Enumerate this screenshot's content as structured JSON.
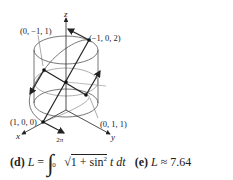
{
  "figure": {
    "axes": {
      "x": "x",
      "y": "y",
      "z": "z"
    },
    "points": {
      "p1": "(0, −1, 1)",
      "p2": "(−1, 0, 2)",
      "p3": "(1, 0, 0)",
      "p4": "(0, 1, 1)"
    }
  },
  "parts": {
    "d": {
      "label": "(d)",
      "lhs": "L",
      "eq": "=",
      "upper": "2π",
      "lower": "0",
      "integrand": "1 + sin",
      "power": "2",
      "rest": "t dt"
    },
    "e": {
      "label": "(e)",
      "lhs": "L",
      "approx": "≈",
      "value": "7.64"
    }
  }
}
